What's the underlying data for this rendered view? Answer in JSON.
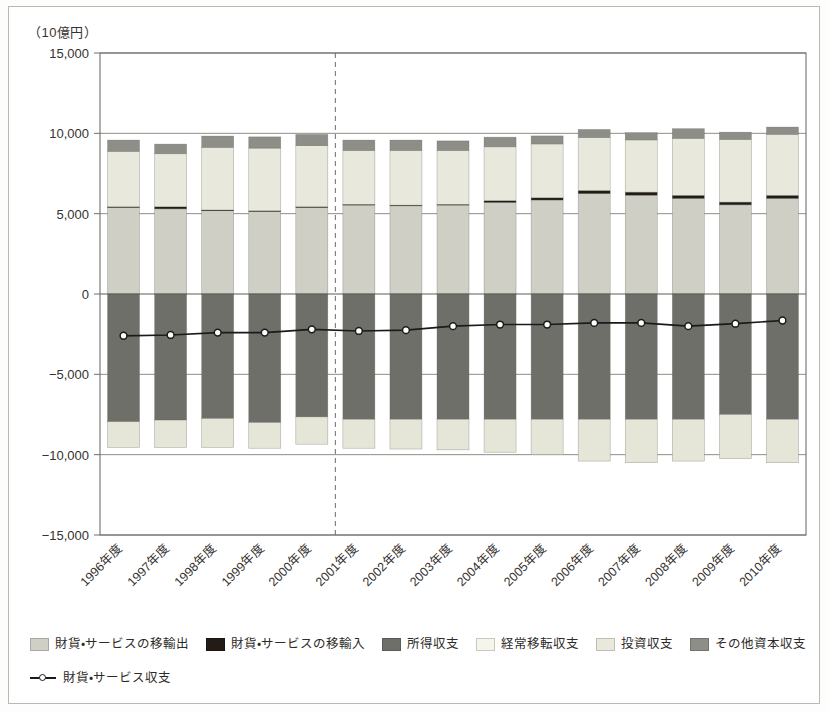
{
  "axis": {
    "unit_label": "（10億円）",
    "y_ticks": [
      "15,000",
      "10,000",
      "5,000",
      "0",
      "−5,000",
      "−10,000",
      "−15,000"
    ]
  },
  "legend": {
    "row1": [
      {
        "label": "財貨・サービスの移輸出",
        "color": "#cfcfc6"
      },
      {
        "label": "財貨・サービスの移輸入",
        "color": "#231c16"
      },
      {
        "label": "所得収支",
        "color": "#6f6f69"
      },
      {
        "label": "経常移転収支",
        "color": "#f6f5ec"
      },
      {
        "label": "投資収支",
        "color": "#e8e8dc"
      },
      {
        "label": "その他資本収支",
        "color": "#8e8e88"
      }
    ],
    "row2": [
      {
        "label": "財貨・サービス収支",
        "color": "#1c1a18",
        "icon": "line-marker-icon"
      }
    ]
  },
  "annotations": {
    "divider_after_category": "2000年度",
    "divider_style": "dashed-vertical"
  },
  "chart_data": {
    "type": "bar",
    "title": "",
    "subtitle": "",
    "xlabel": "",
    "ylabel": "（10億円）",
    "ylim": [
      -15000,
      15000
    ],
    "ytick_values": [
      15000,
      10000,
      5000,
      0,
      -5000,
      -10000,
      -15000
    ],
    "grid": true,
    "legend_position": "bottom",
    "stacked": true,
    "categories": [
      "1996年度",
      "1997年度",
      "1998年度",
      "1999年度",
      "2000年度",
      "2001年度",
      "2002年度",
      "2003年度",
      "2004年度",
      "2005年度",
      "2006年度",
      "2007年度",
      "2008年度",
      "2009年度",
      "2010年度"
    ],
    "series": [
      {
        "name": "財貨・サービスの移輸出",
        "color": "#cfcfc6",
        "values": [
          5400,
          5300,
          5200,
          5150,
          5400,
          5550,
          5500,
          5550,
          5700,
          5850,
          6250,
          6150,
          5950,
          5550,
          5950
        ]
      },
      {
        "name": "財貨・サービスの移輸入",
        "color": "#231c16",
        "values": [
          30,
          130,
          30,
          30,
          30,
          30,
          30,
          30,
          110,
          140,
          190,
          190,
          190,
          170,
          190
        ]
      },
      {
        "name": "投資収支",
        "color": "#e8e8dc",
        "values": [
          3450,
          3300,
          3900,
          3900,
          3800,
          3350,
          3400,
          3350,
          3350,
          3350,
          3300,
          3250,
          3550,
          3900,
          3800
        ]
      },
      {
        "name": "その他資本収支",
        "color": "#8e8e88",
        "values": [
          700,
          600,
          700,
          700,
          700,
          650,
          650,
          600,
          600,
          500,
          500,
          450,
          600,
          450,
          450
        ]
      },
      {
        "name": "所得収支",
        "color": "#6f6f69",
        "values": [
          -7950,
          -7850,
          -7750,
          -8000,
          -7650,
          -7800,
          -7800,
          -7800,
          -7800,
          -7800,
          -7800,
          -7800,
          -7800,
          -7500,
          -7800
        ]
      },
      {
        "name": "経常移転収支",
        "color": "#e6e6d8",
        "values": [
          -1600,
          -1700,
          -1800,
          -1600,
          -1700,
          -1800,
          -1850,
          -1900,
          -2050,
          -2200,
          -2600,
          -2700,
          -2600,
          -2750,
          -2700
        ]
      }
    ],
    "line_series": {
      "name": "財貨・サービス収支",
      "color": "#1c1a18",
      "marker": "circle-open",
      "values": [
        -2600,
        -2550,
        -2400,
        -2400,
        -2200,
        -2300,
        -2250,
        -2000,
        -1900,
        -1900,
        -1800,
        -1800,
        -2000,
        -1850,
        -1650
      ]
    }
  }
}
